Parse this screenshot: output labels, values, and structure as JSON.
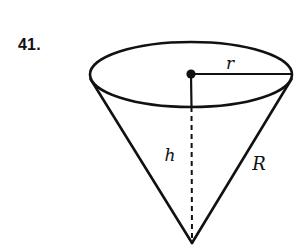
{
  "figure": {
    "problem_number": "41.",
    "shape_name": "inverted-cone",
    "stroke_color": "#111111",
    "background_color": "#ffffff",
    "labels": {
      "radius": "r",
      "height": "h",
      "slant_height": "R"
    },
    "geometry": {
      "ellipse_center_x": 191,
      "ellipse_center_y": 74.5,
      "ellipse_rx": 101,
      "ellipse_ry": 32.5,
      "apex_x": 192,
      "apex_y": 243,
      "center_dot_x": 191,
      "center_dot_y": 74,
      "radius_line_end_x": 292,
      "axis_solid_end_y": 107,
      "left_rim_x": 90,
      "right_rim_x": 292,
      "rim_y": 88
    },
    "label_positions": {
      "r": {
        "x": 230,
        "y": 69
      },
      "h": {
        "x": 170,
        "y": 161
      },
      "R": {
        "x": 251,
        "y": 170
      }
    }
  }
}
